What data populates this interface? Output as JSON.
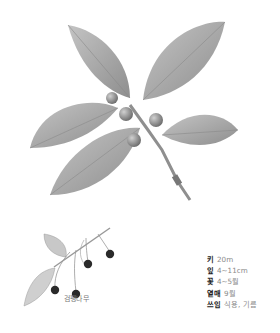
{
  "illustration": {
    "main": "hackberry-branch-with-leaves-and-fruits",
    "detail": "fruiting-twig-with-black-berries"
  },
  "caption": "검팽나무",
  "facts": [
    {
      "label": "키",
      "value": "20m"
    },
    {
      "label": "잎",
      "value": "4~11cm"
    },
    {
      "label": "꽃",
      "value": "4~5월"
    },
    {
      "label": "열매",
      "value": "9월"
    },
    {
      "label": "쓰임",
      "value": "식용, 기름"
    }
  ],
  "colors": {
    "leaf": "#a9a9a9",
    "leaf_dark": "#8c8c8c",
    "berry": "#2a2a2a",
    "stem": "#9a9a9a"
  }
}
